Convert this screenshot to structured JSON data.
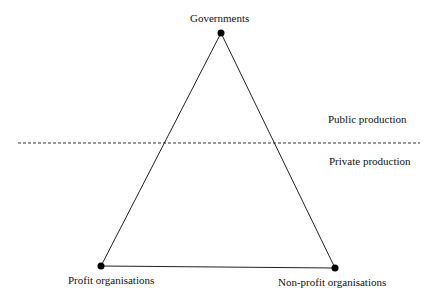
{
  "diagram": {
    "nodes": {
      "top": {
        "label": "Governments"
      },
      "bottom_left": {
        "label": "Profit organisations"
      },
      "bottom_right": {
        "label": "Non-profit organisations"
      }
    },
    "regions": {
      "upper": "Public production",
      "lower": "Private production"
    }
  }
}
